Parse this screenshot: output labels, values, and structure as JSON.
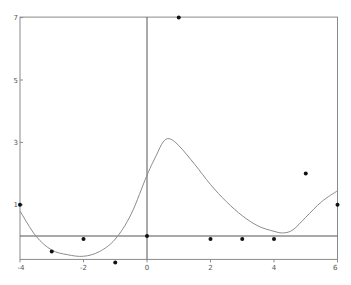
{
  "chart_data": {
    "type": "scatter",
    "title": "",
    "xlabel": "",
    "ylabel": "",
    "xlim": [
      -4,
      6
    ],
    "ylim": [
      -0.75,
      7
    ],
    "grid": false,
    "legend": null,
    "x_ticks": [
      -4,
      -2,
      0,
      2,
      4,
      6
    ],
    "x_tick_labels": [
      "-4",
      "-2",
      "0",
      "2",
      "4",
      "6"
    ],
    "y_ticks": [
      7,
      5,
      3,
      1
    ],
    "y_tick_labels": [
      "7",
      "5",
      "3",
      "1"
    ],
    "series": [
      {
        "name": "data points",
        "kind": "scatter",
        "color": "#111111",
        "x": [
          -4,
          -3,
          -2,
          -1,
          0,
          1,
          2,
          3,
          4,
          5,
          6
        ],
        "y": [
          1,
          -0.5,
          -0.1,
          -0.85,
          0,
          7,
          -0.1,
          -0.1,
          -0.1,
          2,
          1
        ]
      },
      {
        "name": "interpolating curve",
        "kind": "line",
        "color": "#888888",
        "x": [
          -4,
          -3.5,
          -3,
          -2.5,
          -2,
          -1.5,
          -1,
          -0.5,
          0,
          0.3,
          0.5,
          0.7,
          1,
          1.5,
          2,
          2.5,
          3,
          3.5,
          4,
          4.3,
          4.6,
          5,
          5.5,
          6
        ],
        "y": [
          0.8,
          0.0,
          -0.45,
          -0.6,
          -0.65,
          -0.5,
          -0.1,
          0.7,
          1.95,
          2.6,
          3.0,
          3.12,
          2.9,
          2.3,
          1.65,
          1.1,
          0.65,
          0.32,
          0.15,
          0.1,
          0.2,
          0.6,
          1.1,
          1.45
        ]
      }
    ],
    "reference_lines": [
      {
        "orientation": "horizontal",
        "y": 0
      },
      {
        "orientation": "vertical",
        "x": 0
      }
    ]
  },
  "colors": {
    "frame": "#8a8a8a",
    "axis": "#555555",
    "curve": "#8c8c8c",
    "point": "#111111",
    "background": "#ffffff"
  }
}
